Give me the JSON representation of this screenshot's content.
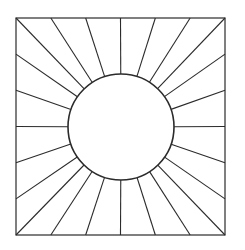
{
  "figure": {
    "stroke_color": "#2b2b2b",
    "background_color": "#ffffff",
    "square": {
      "x": 16,
      "y": 18,
      "width": 209,
      "height": 217,
      "stroke_width": 1.2
    },
    "circle": {
      "cx": 121,
      "cy": 127,
      "r": 53,
      "stroke_width": 1.6
    },
    "rays": {
      "count": 24,
      "divisions_per_side": 6,
      "stroke_width": 1.1
    }
  }
}
